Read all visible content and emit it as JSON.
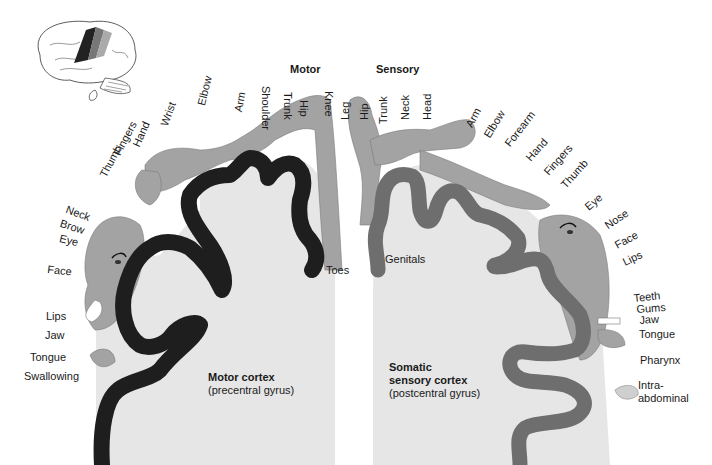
{
  "headers": {
    "motor": "Motor",
    "sensory": "Sensory"
  },
  "motor_labels": {
    "top": [
      "Thumb",
      "Fingers",
      "Hand",
      "Wrist",
      "Elbow",
      "Arm",
      "Shoulder",
      "Trunk",
      "Hip",
      "Knee"
    ],
    "side": [
      "Neck",
      "Brow",
      "Eye",
      "Face",
      "Lips",
      "Jaw",
      "Tongue",
      "Swallowing"
    ],
    "toes": "Toes"
  },
  "sensory_labels": {
    "top": [
      "Leg",
      "Hip",
      "Trunk",
      "Neck",
      "Head",
      "Arm",
      "Elbow",
      "Forearm",
      "Hand",
      "Fingers",
      "Thumb"
    ],
    "side": [
      "Eye",
      "Nose",
      "Face",
      "Lips"
    ],
    "lower": [
      "Teeth",
      "Gums",
      "Jaw",
      "Tongue",
      "Pharynx",
      "Intra-",
      "abdominal"
    ],
    "genitals": "Genitals"
  },
  "captions": {
    "motor_title": "Motor cortex",
    "motor_sub": "(precentral gyrus)",
    "sensory_title_1": "Somatic",
    "sensory_title_2": "sensory cortex",
    "sensory_sub": "(postcentral gyrus)"
  },
  "colors": {
    "motor_cortex": "#1e1e1e",
    "sensory_cortex": "#6e6e6e",
    "body_fill": "#a3a3a3",
    "tissue_fill": "#e6e6e6",
    "background": "#ffffff"
  },
  "icons": {
    "brain_thumbnail": "brain-lateral-view-icon"
  }
}
